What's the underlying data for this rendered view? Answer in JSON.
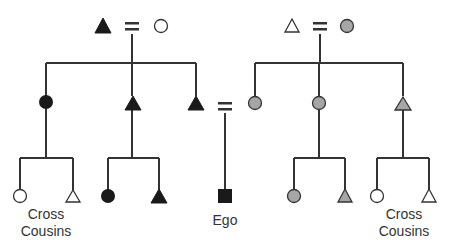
{
  "diagram": {
    "type": "kinship-chart",
    "colors": {
      "line": "#333333",
      "filled": "#1a1a1a",
      "gray": "#a6a6a6",
      "open": "#ffffff",
      "stroke": "#333333"
    },
    "labels": {
      "ego": "Ego",
      "left_cousins_line1": "Cross",
      "left_cousins_line2": "Cousins",
      "right_cousins_line1": "Cross",
      "right_cousins_line2": "Cousins"
    },
    "marriage_symbol": "=",
    "nodes": [
      {
        "id": "pgf",
        "shape": "triangle",
        "fill": "filled",
        "x": 103,
        "y": 27,
        "role": "paternal grandfather"
      },
      {
        "id": "pgm",
        "shape": "circle",
        "fill": "open",
        "x": 161,
        "y": 26,
        "role": "paternal grandmother"
      },
      {
        "id": "mgf",
        "shape": "triangle",
        "fill": "open",
        "x": 292,
        "y": 26,
        "role": "maternal grandfather"
      },
      {
        "id": "mgm",
        "shape": "circle",
        "fill": "gray",
        "x": 347,
        "y": 26,
        "role": "maternal grandmother"
      },
      {
        "id": "fz",
        "shape": "circle",
        "fill": "filled",
        "x": 46,
        "y": 102,
        "role": "father's sister"
      },
      {
        "id": "fb",
        "shape": "triangle",
        "fill": "filled",
        "x": 133,
        "y": 104,
        "role": "father's brother"
      },
      {
        "id": "f",
        "shape": "triangle",
        "fill": "filled",
        "x": 196,
        "y": 104,
        "role": "father"
      },
      {
        "id": "m",
        "shape": "circle",
        "fill": "gray",
        "x": 255,
        "y": 103,
        "role": "mother"
      },
      {
        "id": "mz",
        "shape": "circle",
        "fill": "gray",
        "x": 319,
        "y": 103,
        "role": "mother's sister"
      },
      {
        "id": "mb",
        "shape": "triangle",
        "fill": "gray",
        "x": 403,
        "y": 104,
        "role": "mother's brother"
      },
      {
        "id": "fzd",
        "shape": "circle",
        "fill": "open",
        "x": 20,
        "y": 196
      },
      {
        "id": "fzs",
        "shape": "triangle",
        "fill": "open",
        "x": 73,
        "y": 196
      },
      {
        "id": "fbd",
        "shape": "circle",
        "fill": "filled",
        "x": 108,
        "y": 196
      },
      {
        "id": "fbs",
        "shape": "triangle",
        "fill": "filled",
        "x": 159,
        "y": 196
      },
      {
        "id": "ego",
        "shape": "square",
        "fill": "filled",
        "x": 225,
        "y": 196
      },
      {
        "id": "mzd",
        "shape": "circle",
        "fill": "gray",
        "x": 294,
        "y": 196
      },
      {
        "id": "mzs",
        "shape": "triangle",
        "fill": "gray",
        "x": 345,
        "y": 196
      },
      {
        "id": "mbd",
        "shape": "circle",
        "fill": "open",
        "x": 377,
        "y": 196
      },
      {
        "id": "mbs",
        "shape": "triangle",
        "fill": "open",
        "x": 429,
        "y": 196
      }
    ]
  }
}
